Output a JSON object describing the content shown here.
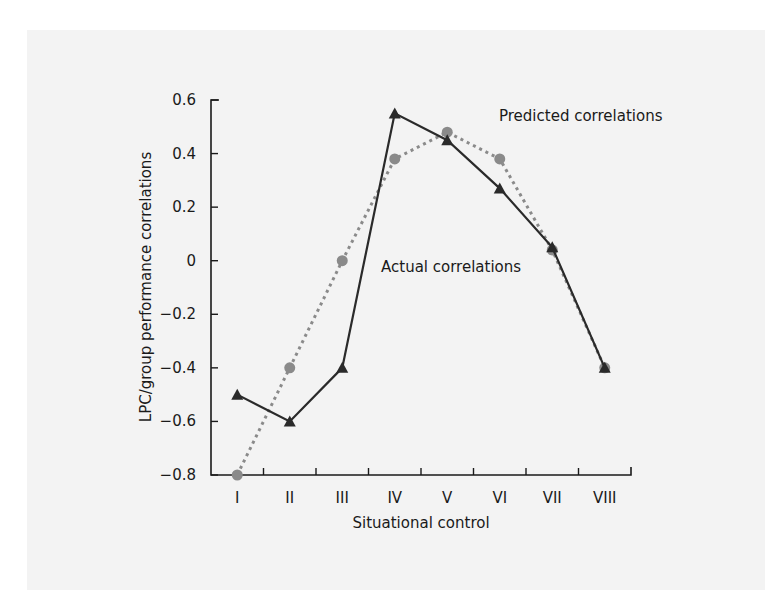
{
  "chart_data": {
    "type": "line",
    "title": "",
    "xlabel": "Situational control",
    "ylabel": "LPC/group performance correlations",
    "categories": [
      "I",
      "II",
      "III",
      "IV",
      "V",
      "VI",
      "VII",
      "VIII"
    ],
    "yticks": [
      0.6,
      0.4,
      0.2,
      0,
      -0.2,
      -0.4,
      -0.6,
      -0.8
    ],
    "ytick_labels": [
      "0.6",
      "0.4",
      "0.2",
      "0",
      "−0.2",
      "−0.4",
      "−0.6",
      "−0.8"
    ],
    "ylim": [
      -0.8,
      0.6
    ],
    "grid": false,
    "legend": "none (inline annotations)",
    "series": [
      {
        "name": "Actual correlations",
        "style": "solid",
        "marker": "triangle",
        "color": "#2a2a2a",
        "values": [
          -0.5,
          -0.6,
          -0.4,
          0.55,
          0.45,
          0.27,
          0.05,
          -0.4
        ]
      },
      {
        "name": "Predicted correlations",
        "style": "dotted",
        "marker": "circle",
        "color": "#8a8a8a",
        "values": [
          -0.8,
          -0.4,
          0.0,
          0.38,
          0.48,
          0.38,
          0.04,
          -0.4
        ]
      }
    ],
    "annotations": [
      {
        "text": "Predicted correlations",
        "near_series": "Predicted correlations"
      },
      {
        "text": "Actual correlations",
        "near_series": "Actual correlations"
      }
    ]
  },
  "labels": {
    "xlabel": "Situational control",
    "ylabel": "LPC/group performance correlations",
    "predicted": "Predicted correlations",
    "actual": "Actual correlations"
  }
}
